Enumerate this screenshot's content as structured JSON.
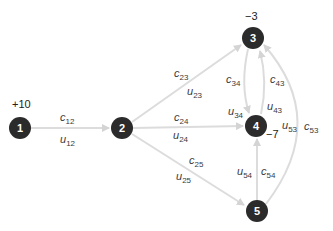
{
  "nodes": [
    {
      "id": "1",
      "label": "1",
      "supply": "+10",
      "x": 20,
      "y": 128
    },
    {
      "id": "2",
      "label": "2",
      "supply": "",
      "x": 122,
      "y": 128
    },
    {
      "id": "3",
      "label": "3",
      "supply": "−3",
      "x": 253,
      "y": 38
    },
    {
      "id": "4",
      "label": "4",
      "supply": "−7",
      "x": 256,
      "y": 126
    },
    {
      "id": "5",
      "label": "5",
      "supply": "",
      "x": 257,
      "y": 211
    }
  ],
  "edges": [
    {
      "from": "1",
      "to": "2",
      "cost": {
        "var": "c",
        "sub": "12"
      },
      "cap": {
        "var": "u",
        "sub": "12"
      }
    },
    {
      "from": "2",
      "to": "3",
      "cost": {
        "var": "c",
        "sub": "23"
      },
      "cap": {
        "var": "u",
        "sub": "23"
      }
    },
    {
      "from": "2",
      "to": "4",
      "cost": {
        "var": "c",
        "sub": "24"
      },
      "cap": {
        "var": "u",
        "sub": "24"
      }
    },
    {
      "from": "2",
      "to": "5",
      "cost": {
        "var": "c",
        "sub": "25"
      },
      "cap": {
        "var": "u",
        "sub": "25"
      }
    },
    {
      "from": "3",
      "to": "4",
      "cost": {
        "var": "c",
        "sub": "34"
      },
      "cap": {
        "var": "u",
        "sub": "34"
      }
    },
    {
      "from": "4",
      "to": "3",
      "cost": {
        "var": "c",
        "sub": "43"
      },
      "cap": {
        "var": "u",
        "sub": "43"
      }
    },
    {
      "from": "5",
      "to": "4",
      "cost": {
        "var": "c",
        "sub": "54"
      },
      "cap": {
        "var": "u",
        "sub": "54"
      }
    },
    {
      "from": "5",
      "to": "3",
      "cost": {
        "var": "c",
        "sub": "53"
      },
      "cap": {
        "var": "u",
        "sub": "53"
      }
    }
  ],
  "colors": {
    "node_fill": "#2b2b2b",
    "edge": "#d9d9d9",
    "text": "#3a3a3a"
  }
}
